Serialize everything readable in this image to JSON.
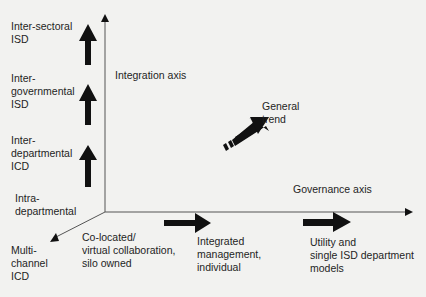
{
  "diagram": {
    "axes": {
      "integration_axis_label": "Integration axis",
      "governance_axis_label": "Governance axis"
    },
    "integration_levels": [
      "Inter-sectoral\nISD",
      "Inter-\ngovernmental\nISD",
      "Inter-\ndepartmental\nICD",
      "Intra-\ndepartmental",
      "Multi-\nchannel\nICD"
    ],
    "governance_levels": [
      "Co-located/\nvirtual collaboration,\nsilo owned",
      "Integrated\nmanagement,\nindividual",
      "Utility and\nsingle ISD department\nmodels"
    ],
    "trend_label": "General\ntrend",
    "colors": {
      "arrow_fill": "#111111",
      "axis_line": "#555555",
      "background": "#f2f2f0"
    }
  }
}
